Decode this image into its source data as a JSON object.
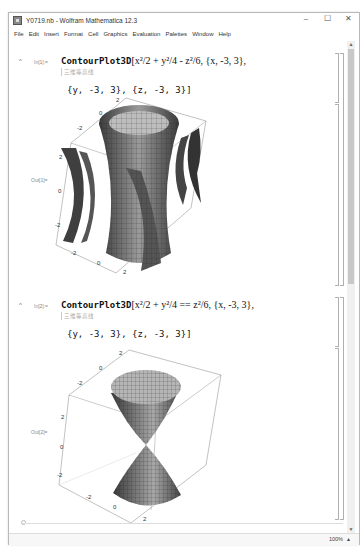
{
  "window": {
    "title": "Y0719.nb - Wolfram Mathematica 12.3",
    "controls": {
      "minimize": "–",
      "maximize": "☐",
      "close": "✕"
    }
  },
  "menubar": {
    "items": [
      "File",
      "Edit",
      "Insert",
      "Format",
      "Cell",
      "Graphics",
      "Evaluation",
      "Palettes",
      "Window",
      "Help"
    ]
  },
  "cells": [
    {
      "in_label": "In[1]:=",
      "func": "ContourPlot3D",
      "expr": "[x²/2 + y²/4 - z²/6, {x, -3, 3},",
      "hint": "三维等高线",
      "line2": "{y, -3, 3}, {z, -3, 3}]",
      "out_label": "Out[1]=",
      "ticks": {
        "x": [
          "-2",
          "0",
          "2"
        ],
        "y": [
          "-2",
          "0",
          "2"
        ],
        "z": [
          "2",
          "0",
          "-2"
        ]
      }
    },
    {
      "in_label": "In[2]:=",
      "func": "ContourPlot3D",
      "expr": "[x²/2 + y²/4 == z²/6, {x, -3, 3},",
      "hint": "三维等高线",
      "line2": "{y, -3, 3}, {z, -3, 3}]",
      "out_label": "Out[2]=",
      "ticks": {
        "x": [
          "-2",
          "0",
          "2"
        ],
        "y": [
          "-2",
          "0",
          "2"
        ],
        "z": [
          "2",
          "0",
          "-2"
        ]
      }
    }
  ],
  "statusbar": {
    "zoom": "100%",
    "zoom_arrow": "▲"
  },
  "scrollbar": {
    "up": "▲",
    "down": "▼"
  }
}
